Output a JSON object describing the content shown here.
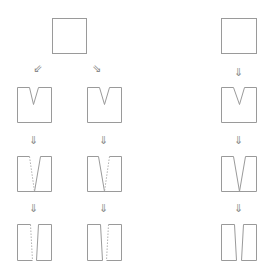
{
  "diagram": {
    "colors": {
      "line": "#9a9a9a",
      "dashed": "#b0b0b0",
      "arrow": "#8a8a8a"
    },
    "arrows": {
      "down_left": "⇙",
      "down_right": "⇘",
      "down": "⇓"
    },
    "branches": [
      {
        "name": "left-branch",
        "stages": [
          "square",
          "notched",
          "cut-to-base",
          "split"
        ]
      },
      {
        "name": "middle-branch",
        "stages": [
          "square",
          "notched",
          "cut-to-base",
          "split"
        ]
      },
      {
        "name": "right-column",
        "stages": [
          "square",
          "notched",
          "cut-to-base",
          "split"
        ]
      }
    ]
  }
}
